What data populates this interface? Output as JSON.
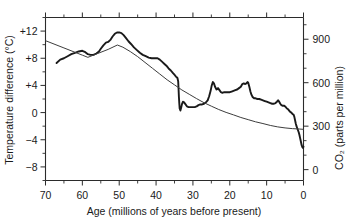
{
  "chart_data": {
    "type": "line",
    "title": "",
    "xlabel": "Age (millions of years before present)",
    "ylabel": "Temperature difference (°C)",
    "y2label": "CO₂ (parts per million)",
    "xlim": [
      70,
      0
    ],
    "ylim": [
      -10,
      14
    ],
    "y2lim": [
      -75,
      1050
    ],
    "x_reversed": true,
    "grid": false,
    "legend": "none",
    "xticks": [
      70,
      60,
      50,
      40,
      30,
      20,
      10,
      0
    ],
    "xticklabels": [
      "70",
      "60",
      "50",
      "40",
      "30",
      "20",
      "10",
      "0"
    ],
    "x_minor_interval": 5,
    "yticks": [
      12,
      8,
      4,
      0,
      -4,
      -8
    ],
    "yticklabels": [
      "+12",
      "+8",
      "+4",
      "0",
      "−4",
      "−8"
    ],
    "y2ticks": [
      900,
      600,
      300,
      0
    ],
    "y2ticklabels": [
      "900",
      "600",
      "300",
      "0"
    ],
    "y2_minor_interval": 100,
    "series": [
      {
        "name": "Temperature difference",
        "axis": "left",
        "units": "°C",
        "stroke": "#1a1a1a",
        "points": [
          [
            67.0,
            7.3
          ],
          [
            66.0,
            7.8
          ],
          [
            65.0,
            8.0
          ],
          [
            64.0,
            8.3
          ],
          [
            63.0,
            8.6
          ],
          [
            62.0,
            8.8
          ],
          [
            61.0,
            9.0
          ],
          [
            60.0,
            9.1
          ],
          [
            59.2,
            8.9
          ],
          [
            58.5,
            8.6
          ],
          [
            57.8,
            8.5
          ],
          [
            57.0,
            8.5
          ],
          [
            56.2,
            8.7
          ],
          [
            55.5,
            9.0
          ],
          [
            55.0,
            9.4
          ],
          [
            54.3,
            9.9
          ],
          [
            53.6,
            10.3
          ],
          [
            53.0,
            10.4
          ],
          [
            52.4,
            10.7
          ],
          [
            51.8,
            11.2
          ],
          [
            51.2,
            11.6
          ],
          [
            50.6,
            11.8
          ],
          [
            50.0,
            11.8
          ],
          [
            49.4,
            11.7
          ],
          [
            48.8,
            11.4
          ],
          [
            48.2,
            11.0
          ],
          [
            47.5,
            10.5
          ],
          [
            46.8,
            10.1
          ],
          [
            46.0,
            9.6
          ],
          [
            45.2,
            9.2
          ],
          [
            44.4,
            8.8
          ],
          [
            43.6,
            8.5
          ],
          [
            42.8,
            8.3
          ],
          [
            42.0,
            8.1
          ],
          [
            41.2,
            8.0
          ],
          [
            40.4,
            8.0
          ],
          [
            39.6,
            8.0
          ],
          [
            39.0,
            7.8
          ],
          [
            38.4,
            7.5
          ],
          [
            37.8,
            7.2
          ],
          [
            37.2,
            6.9
          ],
          [
            36.6,
            6.5
          ],
          [
            36.0,
            6.2
          ],
          [
            35.4,
            5.8
          ],
          [
            34.9,
            5.5
          ],
          [
            34.6,
            5.3
          ],
          [
            34.4,
            5.2
          ],
          [
            34.2,
            5.1
          ],
          [
            34.0,
            4.6
          ],
          [
            33.9,
            3.5
          ],
          [
            33.8,
            2.3
          ],
          [
            33.7,
            1.4
          ],
          [
            33.6,
            0.6
          ],
          [
            33.4,
            0.3
          ],
          [
            33.2,
            0.7
          ],
          [
            33.0,
            1.2
          ],
          [
            32.7,
            1.6
          ],
          [
            32.4,
            1.5
          ],
          [
            32.0,
            1.2
          ],
          [
            31.6,
            0.9
          ],
          [
            31.2,
            0.8
          ],
          [
            30.8,
            0.8
          ],
          [
            30.4,
            0.8
          ],
          [
            30.0,
            0.8
          ],
          [
            29.5,
            0.8
          ],
          [
            29.0,
            0.9
          ],
          [
            28.5,
            1.1
          ],
          [
            28.0,
            1.2
          ],
          [
            27.5,
            1.2
          ],
          [
            27.0,
            1.3
          ],
          [
            26.5,
            1.5
          ],
          [
            26.0,
            1.8
          ],
          [
            25.6,
            2.4
          ],
          [
            25.2,
            3.2
          ],
          [
            24.9,
            4.0
          ],
          [
            24.6,
            4.5
          ],
          [
            24.3,
            4.3
          ],
          [
            24.0,
            3.8
          ],
          [
            23.6,
            3.4
          ],
          [
            23.2,
            3.6
          ],
          [
            22.8,
            3.3
          ],
          [
            22.4,
            3.0
          ],
          [
            22.0,
            2.9
          ],
          [
            21.5,
            3.0
          ],
          [
            21.0,
            3.0
          ],
          [
            20.5,
            3.0
          ],
          [
            20.0,
            3.0
          ],
          [
            19.5,
            3.1
          ],
          [
            19.0,
            3.2
          ],
          [
            18.5,
            3.3
          ],
          [
            18.0,
            3.4
          ],
          [
            17.5,
            3.6
          ],
          [
            17.0,
            3.8
          ],
          [
            16.6,
            4.2
          ],
          [
            16.2,
            4.3
          ],
          [
            15.8,
            4.2
          ],
          [
            15.5,
            4.3
          ],
          [
            15.2,
            4.5
          ],
          [
            15.0,
            4.4
          ],
          [
            14.7,
            3.8
          ],
          [
            14.4,
            3.1
          ],
          [
            14.1,
            2.6
          ],
          [
            13.8,
            2.3
          ],
          [
            13.4,
            2.1
          ],
          [
            13.0,
            2.1
          ],
          [
            12.5,
            2.0
          ],
          [
            12.0,
            2.0
          ],
          [
            11.5,
            1.9
          ],
          [
            11.0,
            1.8
          ],
          [
            10.5,
            1.7
          ],
          [
            10.0,
            1.6
          ],
          [
            9.5,
            1.5
          ],
          [
            9.0,
            1.4
          ],
          [
            8.5,
            1.3
          ],
          [
            8.0,
            1.3
          ],
          [
            7.6,
            1.4
          ],
          [
            7.2,
            1.6
          ],
          [
            6.9,
            1.8
          ],
          [
            6.6,
            1.6
          ],
          [
            6.3,
            1.3
          ],
          [
            6.0,
            1.1
          ],
          [
            5.6,
            1.0
          ],
          [
            5.2,
            1.0
          ],
          [
            4.8,
            0.8
          ],
          [
            4.5,
            0.6
          ],
          [
            4.2,
            0.5
          ],
          [
            3.9,
            0.3
          ],
          [
            3.6,
            0.1
          ],
          [
            3.3,
            0.0
          ],
          [
            3.0,
            -0.2
          ],
          [
            2.7,
            -0.3
          ],
          [
            2.5,
            -0.6
          ],
          [
            2.3,
            -1.1
          ],
          [
            2.1,
            -1.6
          ],
          [
            1.9,
            -2.0
          ],
          [
            1.7,
            -2.3
          ],
          [
            1.5,
            -2.6
          ],
          [
            1.3,
            -2.9
          ],
          [
            1.1,
            -3.3
          ],
          [
            0.9,
            -3.8
          ],
          [
            0.7,
            -4.3
          ],
          [
            0.5,
            -4.8
          ],
          [
            0.3,
            -5.1
          ],
          [
            0.15,
            -5.2
          ],
          [
            0.0,
            -5.0
          ]
        ]
      },
      {
        "name": "CO2 concentration",
        "axis": "right",
        "units": "parts per million",
        "stroke": "#3d3d3d",
        "points": [
          [
            70.0,
            890
          ],
          [
            65.0,
            840
          ],
          [
            60.0,
            790
          ],
          [
            58.5,
            775
          ],
          [
            56.0,
            800
          ],
          [
            53.0,
            830
          ],
          [
            50.5,
            860
          ],
          [
            49.0,
            845
          ],
          [
            47.0,
            815
          ],
          [
            45.0,
            780
          ],
          [
            43.0,
            740
          ],
          [
            41.0,
            700
          ],
          [
            39.0,
            660
          ],
          [
            37.0,
            620
          ],
          [
            35.0,
            585
          ],
          [
            33.0,
            550
          ],
          [
            31.0,
            520
          ],
          [
            29.0,
            490
          ],
          [
            27.0,
            462
          ],
          [
            25.0,
            438
          ],
          [
            23.0,
            415
          ],
          [
            21.0,
            395
          ],
          [
            19.0,
            378
          ],
          [
            17.0,
            360
          ],
          [
            15.0,
            345
          ],
          [
            13.0,
            330
          ],
          [
            11.0,
            318
          ],
          [
            9.0,
            305
          ],
          [
            7.0,
            295
          ],
          [
            5.0,
            288
          ],
          [
            3.0,
            283
          ],
          [
            1.0,
            280
          ],
          [
            0.0,
            278
          ]
        ]
      }
    ]
  },
  "axes": {
    "left_title": "Temperature difference (°C)",
    "bottom_title": "Age (millions of years before present)",
    "right_title": "CO₂ (parts per million)"
  }
}
